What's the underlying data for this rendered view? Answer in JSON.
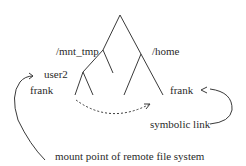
{
  "diagram": {
    "type": "directory-tree",
    "labels": {
      "mnt_tmp": "/mnt_tmp",
      "home": "/home",
      "user2": "user2",
      "frank_left": "frank",
      "frank_right": "frank",
      "symbolic_link": "symbolic link",
      "mount_point": "mount point of remote file system"
    },
    "edges": [
      {
        "from": "root",
        "to": "/mnt_tmp"
      },
      {
        "from": "root",
        "to": "/home"
      },
      {
        "from": "/mnt_tmp",
        "to": "user2"
      },
      {
        "from": "/home",
        "to": "frank"
      },
      {
        "from": "user2",
        "to": "frank"
      },
      {
        "from": "frank (mnt_tmp)",
        "to": "frank (home)",
        "style": "dashed",
        "meaning": "symbolic link"
      }
    ],
    "colors": {
      "line": "#3a3a3a",
      "text": "#2a2a2a"
    }
  }
}
